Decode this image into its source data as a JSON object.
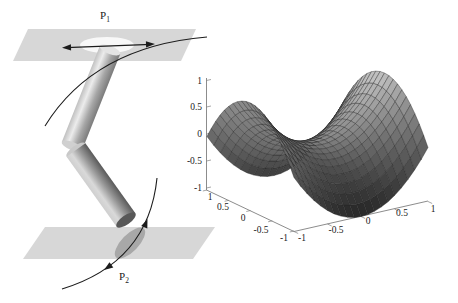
{
  "pendulum_diagram": {
    "labels": {
      "p1": {
        "base": "P",
        "sub": "1"
      },
      "p2": {
        "base": "P",
        "sub": "2"
      }
    },
    "colors": {
      "plane": "#d7d7d7",
      "hole_disk": "#f8f8f8",
      "contact_disk": "#a8a8a8",
      "arrow": "#1c1c1c"
    }
  },
  "chart_data": {
    "type": "surface",
    "function": "z = x^2 - y^2",
    "x_range": [
      -1,
      1
    ],
    "y_range": [
      -1,
      1
    ],
    "z_range": [
      -1,
      1
    ],
    "x_tick_labels": [
      "-1",
      "-0.5",
      "0",
      "0.5",
      "1"
    ],
    "y_tick_labels": [
      "1",
      "0.5",
      "0",
      "-0.5",
      "-1"
    ],
    "z_tick_labels": [
      "1",
      "0.5",
      "0",
      "-0.5",
      "-1"
    ],
    "grid_divisions": 20,
    "colormap": "grayscale-by-height",
    "view": {
      "azimuth": -37.5,
      "elevation": 30
    },
    "grid": false,
    "legend": false
  },
  "colors": {
    "background": "#ffffff",
    "axis_line": "#7f7f7f",
    "tick_text": "#1a1a1a",
    "surface_light": "#d2d2d2",
    "surface_dark": "#3c3c3c",
    "mesh_line": "#2a2a2a"
  }
}
